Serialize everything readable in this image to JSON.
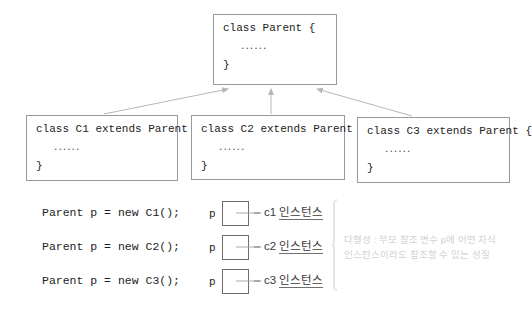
{
  "diagram": {
    "colors": {
      "box_border": "#9a9a9a",
      "ref_box_border": "#6d6d6d",
      "arrow": "#b0b0b0",
      "code_text": "#1d1d1d",
      "instance_text": "#3b3b3b",
      "annotation_text": "#d2d2d2",
      "background": "#ffffff"
    }
  },
  "classes": {
    "parent": {
      "signature": "class Parent {",
      "body": "......",
      "close": "}"
    },
    "children": [
      {
        "signature": "class C1 extends Parent {",
        "body": "......",
        "close": "}"
      },
      {
        "signature": "class C2 extends Parent {",
        "body": "......",
        "close": "}"
      },
      {
        "signature": "class C3 extends Parent {",
        "body": "......",
        "close": "}"
      }
    ]
  },
  "instantiations": [
    {
      "code": "Parent p = new C1();",
      "ref_label": "p",
      "instance_prefix": "c1 ",
      "instance_suffix": "인스턴스"
    },
    {
      "code": "Parent p = new C2();",
      "ref_label": "p",
      "instance_prefix": "c2 ",
      "instance_suffix": "인스턴스"
    },
    {
      "code": "Parent p = new C3();",
      "ref_label": "p",
      "instance_prefix": "c3 ",
      "instance_suffix": "인스턴스"
    }
  ],
  "annotation": {
    "line1": "다형성 : 부모 참조 변수 p에 어떤 자식",
    "line2": "인스턴스이라도 참조할 수 있는 성질"
  }
}
